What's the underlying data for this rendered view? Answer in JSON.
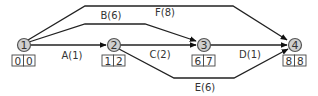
{
  "diagram": {
    "type": "activity-on-arrow network",
    "nodes": [
      {
        "id": "1",
        "label": "1",
        "x": 24,
        "y": 45,
        "early": "0",
        "late": "0"
      },
      {
        "id": "2",
        "label": "2",
        "x": 114,
        "y": 45,
        "early": "1",
        "late": "2"
      },
      {
        "id": "3",
        "label": "3",
        "x": 204,
        "y": 45,
        "early": "6",
        "late": "7"
      },
      {
        "id": "4",
        "label": "4",
        "x": 295,
        "y": 45,
        "early": "8",
        "late": "8"
      }
    ],
    "edges": [
      {
        "id": "A",
        "label": "A(1)",
        "from": "1",
        "to": "2",
        "duration": 1
      },
      {
        "id": "B",
        "label": "B(6)",
        "from": "1",
        "to": "3",
        "duration": 6
      },
      {
        "id": "C",
        "label": "C(2)",
        "from": "2",
        "to": "3",
        "duration": 2
      },
      {
        "id": "D",
        "label": "D(1)",
        "from": "3",
        "to": "4",
        "duration": 1
      },
      {
        "id": "E",
        "label": "E(6)",
        "from": "2",
        "to": "4",
        "duration": 6
      },
      {
        "id": "F",
        "label": "F(8)",
        "from": "1",
        "to": "4",
        "duration": 8
      }
    ]
  }
}
